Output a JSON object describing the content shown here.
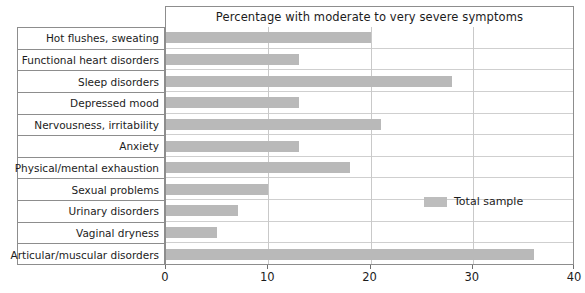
{
  "chart_data": {
    "type": "bar",
    "orientation": "horizontal",
    "title": "Percentage with moderate to very severe symptoms",
    "xlabel": "",
    "ylabel": "",
    "xlim": [
      0,
      40
    ],
    "xticks": [
      0,
      10,
      20,
      30,
      40
    ],
    "xtick_labels": [
      "0",
      "10",
      "20",
      "30",
      "40"
    ],
    "grid": true,
    "grid_axis": "x",
    "legend_position": "inside-right",
    "categories": [
      "Hot flushes, sweating",
      "Functional heart disorders",
      "Sleep disorders",
      "Depressed mood",
      "Nervousness, irritability",
      "Anxiety",
      "Physical/mental exhaustion",
      "Sexual problems",
      "Urinary disorders",
      "Vaginal dryness",
      "Articular/muscular disorders"
    ],
    "series": [
      {
        "name": "Total sample",
        "color": "#b9b9b9",
        "values": [
          20,
          13,
          28,
          13,
          21,
          13,
          18,
          10,
          7,
          5,
          36
        ]
      }
    ]
  },
  "legend": {
    "entries": [
      {
        "label": "Total sample",
        "color": "#b9b9b9"
      }
    ]
  },
  "colors": {
    "bar": "#b9b9b9",
    "border": "#8d8d8d",
    "gridline": "#c9c9c9",
    "text": "#1c1c1c",
    "background": "#ffffff"
  }
}
